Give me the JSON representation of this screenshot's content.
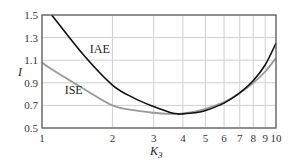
{
  "chart_data": {
    "type": "line",
    "title": "",
    "xlabel": "K3",
    "xlabel_main": "K",
    "xlabel_sub": "3",
    "ylabel": "I",
    "xscale": "log",
    "xlim": [
      1,
      10
    ],
    "ylim": [
      0.5,
      1.5
    ],
    "grid": true,
    "legend": "inline labels",
    "xticks": [
      1,
      2,
      3,
      4,
      5,
      6,
      7,
      8,
      9,
      10
    ],
    "xtick_labels": [
      "1",
      "2",
      "3",
      "4",
      "5",
      "6",
      "7",
      "8",
      "9",
      "10"
    ],
    "yticks": [
      0.5,
      0.7,
      0.9,
      1.1,
      1.3,
      1.5
    ],
    "ytick_labels": [
      "0.5",
      "0.7",
      "0.9",
      "1.1",
      "1.3",
      "1.5"
    ],
    "x": [
      1,
      1.1,
      1.5,
      2,
      2.5,
      3,
      3.5,
      3.8,
      4,
      4.5,
      5,
      6,
      7,
      8,
      9,
      10
    ],
    "series": [
      {
        "name": "IAE",
        "color": "#111111",
        "values": [
          null,
          1.5,
          1.15,
          0.88,
          0.76,
          0.69,
          0.64,
          0.625,
          0.625,
          0.635,
          0.655,
          0.72,
          0.81,
          0.92,
          1.06,
          1.25
        ]
      },
      {
        "name": "ISE",
        "color": "#999999",
        "values": [
          1.08,
          1.02,
          0.85,
          0.7,
          0.655,
          0.635,
          0.625,
          0.625,
          0.63,
          0.645,
          0.67,
          0.73,
          0.81,
          0.9,
          1.0,
          1.12
        ]
      }
    ],
    "annotations": [
      {
        "text": "IAE",
        "x": 1.6,
        "y": 1.2
      },
      {
        "text": "ISE",
        "x": 1.25,
        "y": 0.84
      }
    ]
  }
}
